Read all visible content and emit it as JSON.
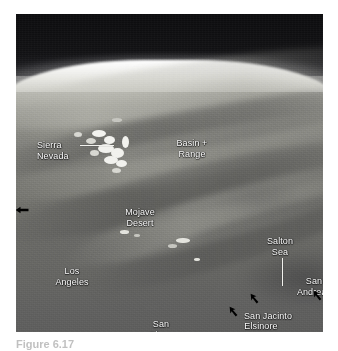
{
  "figure": {
    "kind": "annotated-space-photograph",
    "caption": "Figure 6.17",
    "photo_frame": {
      "left": 16,
      "top": 14,
      "width": 307,
      "height": 318
    }
  },
  "annotations": {
    "labels": [
      {
        "id": "sierra-nevada",
        "text": "Sierra\nNevada",
        "x": 21,
        "y": 126,
        "align": "left",
        "leader": {
          "type": "horizontal",
          "x": 64,
          "y": 131,
          "length": 34
        }
      },
      {
        "id": "basin-and-range",
        "text": "Basin +\nRange",
        "x": 176,
        "y": 124,
        "align": "center"
      },
      {
        "id": "mojave-desert",
        "text": "Mojave\nDesert",
        "x": 124,
        "y": 193,
        "align": "center"
      },
      {
        "id": "salton-sea",
        "text": "Salton\nSea",
        "x": 264,
        "y": 222,
        "align": "center",
        "leader": {
          "type": "vertical",
          "x": 266,
          "y": 244,
          "length": 28
        }
      },
      {
        "id": "los-angeles",
        "text": "Los\nAngeles",
        "x": 56,
        "y": 252,
        "align": "center"
      },
      {
        "id": "san-andreas",
        "text": "San\nAndreas",
        "x": 298,
        "y": 262,
        "align": "center"
      },
      {
        "id": "san-jacinto",
        "text": "San Jacinto",
        "x": 252,
        "y": 297,
        "align": "center"
      },
      {
        "id": "elsinore",
        "text": "Elsinore",
        "x": 245,
        "y": 307,
        "align": "center"
      },
      {
        "id": "san-diego",
        "text": "San\nDiego",
        "x": 145,
        "y": 305,
        "align": "center"
      }
    ],
    "fault_arrows": [
      {
        "id": "san-andreas-arrow",
        "x": 303,
        "y": 281,
        "rotation": -35
      },
      {
        "id": "san-jacinto-arrow",
        "x": 240,
        "y": 284,
        "rotation": -35
      },
      {
        "id": "elsinore-arrow",
        "x": 219,
        "y": 297,
        "rotation": -35
      }
    ],
    "edge_arrow": {
      "id": "left-edge-arrow",
      "x": 14,
      "y": 196,
      "direction": "left"
    }
  },
  "colors": {
    "label_text": "#ffffff",
    "leader_line": "#f2f2ee",
    "arrow": "#000000",
    "sky": "#0c0c0e",
    "limb_highlight": "#ffffff",
    "terrain_light": "#b9b9b2",
    "terrain_dark": "#5d5d5c",
    "caption_text": "#8d8d8d",
    "page_background": "#ffffff"
  }
}
